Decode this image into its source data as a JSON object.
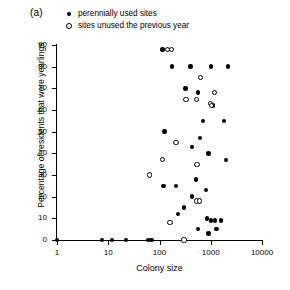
{
  "panel": {
    "label": "(a)"
  },
  "legend": {
    "entries": [
      {
        "marker": "filled-circle-icon",
        "label": "perennially used sites"
      },
      {
        "marker": "open-circle-icon",
        "label": "sites unused the previous year"
      }
    ]
  },
  "chart_data": {
    "type": "scatter",
    "title": "",
    "xlabel": "Colony size",
    "ylabel": "Percentage of residents that were yearlings",
    "xscale": "log",
    "yscale": "linear",
    "xlim": [
      1,
      10000
    ],
    "ylim": [
      0,
      90
    ],
    "xticks": [
      1,
      10,
      100,
      1000,
      10000
    ],
    "xtick_labels": [
      "1",
      "10",
      "100",
      "1000",
      "10000"
    ],
    "yticks": [
      0,
      10,
      20,
      30,
      40,
      50,
      60,
      70,
      80,
      90
    ],
    "ytick_labels": [
      "0",
      "10",
      "20",
      "30",
      "40",
      "50",
      "60",
      "70",
      "80",
      "90"
    ],
    "grid": false,
    "legend_position": "above-plot",
    "series": [
      {
        "name": "perennially used sites",
        "marker": "filled-circle",
        "color": "#000000",
        "points": [
          [
            1,
            0
          ],
          [
            7.5,
            0
          ],
          [
            12,
            0
          ],
          [
            22,
            0
          ],
          [
            60,
            0
          ],
          [
            70,
            0
          ],
          [
            300,
            0
          ],
          [
            115,
            88
          ],
          [
            175,
            80
          ],
          [
            400,
            80
          ],
          [
            1000,
            80
          ],
          [
            2200,
            80
          ],
          [
            125,
            50
          ],
          [
            320,
            70
          ],
          [
            560,
            68
          ],
          [
            1100,
            62
          ],
          [
            700,
            55
          ],
          [
            1800,
            55
          ],
          [
            620,
            47
          ],
          [
            430,
            43
          ],
          [
            900,
            40
          ],
          [
            2000,
            37
          ],
          [
            120,
            25
          ],
          [
            210,
            25
          ],
          [
            520,
            28
          ],
          [
            800,
            23
          ],
          [
            430,
            20
          ],
          [
            300,
            15
          ],
          [
            230,
            12
          ],
          [
            850,
            10
          ],
          [
            1000,
            9
          ],
          [
            1200,
            9
          ],
          [
            1600,
            9
          ],
          [
            560,
            5
          ],
          [
            1300,
            5
          ],
          [
            900,
            3
          ]
        ]
      },
      {
        "name": "sites unused the previous year",
        "marker": "open-circle",
        "color": "#000000",
        "points": [
          [
            145,
            88
          ],
          [
            170,
            88
          ],
          [
            640,
            75
          ],
          [
            330,
            65
          ],
          [
            520,
            65
          ],
          [
            1000,
            63
          ],
          [
            1200,
            68
          ],
          [
            1050,
            62
          ],
          [
            115,
            37
          ],
          [
            210,
            45
          ],
          [
            540,
            35
          ],
          [
            65,
            30
          ],
          [
            520,
            18
          ],
          [
            600,
            18
          ],
          [
            160,
            8
          ],
          [
            300,
            0
          ]
        ]
      }
    ]
  }
}
